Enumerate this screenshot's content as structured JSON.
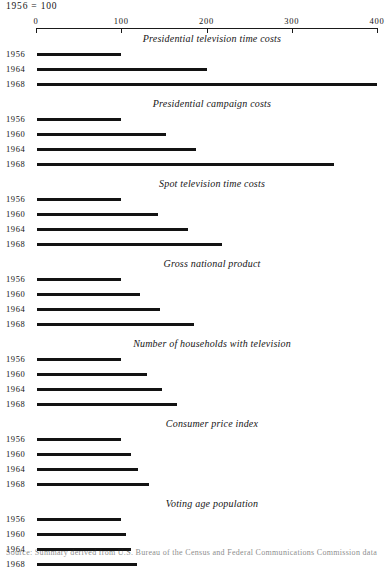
{
  "header": {
    "index_note": "1956 = 100"
  },
  "axis": {
    "min": 0,
    "max": 400,
    "ticks": [
      0,
      100,
      200,
      300,
      400
    ],
    "tick_labels": [
      "0",
      "100",
      "200",
      "300",
      "400"
    ],
    "pixel_start": 36,
    "pixel_end": 377
  },
  "footer": {
    "source_note": "Source: Summary derived from U.S. Bureau of the Census and Federal Communications Commission data"
  },
  "chart_data": {
    "type": "bar",
    "orientation": "horizontal",
    "title": "",
    "xlabel": "",
    "ylabel": "",
    "xlim": [
      0,
      400
    ],
    "grid": false,
    "legend": "none",
    "index_base": "1956 = 100",
    "panels": [
      {
        "title": "Presidential television time costs",
        "categories": [
          "1956",
          "1964",
          "1968"
        ],
        "values": [
          100,
          200,
          400
        ]
      },
      {
        "title": "Presidential campaign costs",
        "categories": [
          "1956",
          "1960",
          "1964",
          "1968"
        ],
        "values": [
          100,
          152,
          188,
          350
        ]
      },
      {
        "title": "Spot television time costs",
        "categories": [
          "1956",
          "1960",
          "1964",
          "1968"
        ],
        "values": [
          100,
          143,
          178,
          218
        ]
      },
      {
        "title": "Gross national product",
        "categories": [
          "1956",
          "1960",
          "1964",
          "1968"
        ],
        "values": [
          100,
          122,
          145,
          185
        ]
      },
      {
        "title": "Number of households with television",
        "categories": [
          "1956",
          "1960",
          "1964",
          "1968"
        ],
        "values": [
          100,
          130,
          148,
          165
        ]
      },
      {
        "title": "Consumer price index",
        "categories": [
          "1956",
          "1960",
          "1964",
          "1968"
        ],
        "values": [
          100,
          112,
          120,
          133
        ]
      },
      {
        "title": "Voting age population",
        "categories": [
          "1956",
          "1960",
          "1964",
          "1968"
        ],
        "values": [
          100,
          106,
          111,
          118
        ]
      }
    ]
  }
}
